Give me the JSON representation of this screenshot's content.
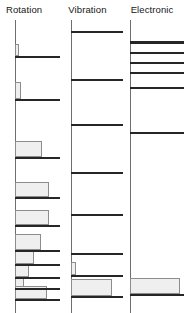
{
  "figure": {
    "width": 187,
    "height": 313,
    "background": "#ffffff",
    "bar_color": "#262626",
    "box_fill": "#efefef",
    "box_stroke": "#8c8c8c",
    "axis_color": "#6e6e6e"
  },
  "chart_data": {
    "type": "bar",
    "title": "",
    "subtitle": "",
    "xlabel": "",
    "ylabel": "",
    "grid": false,
    "legend": "none",
    "orientation": "horizontal",
    "panels": [
      {
        "label": "Rotation",
        "axis_x_pct": 24,
        "bars": [
          {
            "y_pct": 12.4,
            "start_pct": 24,
            "width_pct": 72,
            "thickness_px": 2
          },
          {
            "y_pct": 26.8,
            "start_pct": 24,
            "width_pct": 72,
            "thickness_px": 2
          },
          {
            "y_pct": 46.6,
            "start_pct": 24,
            "width_pct": 72,
            "thickness_px": 2
          },
          {
            "y_pct": 60.5,
            "start_pct": 24,
            "width_pct": 72,
            "thickness_px": 2
          },
          {
            "y_pct": 70.0,
            "start_pct": 24,
            "width_pct": 72,
            "thickness_px": 2
          },
          {
            "y_pct": 78.5,
            "start_pct": 24,
            "width_pct": 72,
            "thickness_px": 2
          },
          {
            "y_pct": 83.4,
            "start_pct": 24,
            "width_pct": 72,
            "thickness_px": 2
          },
          {
            "y_pct": 87.6,
            "start_pct": 24,
            "width_pct": 72,
            "thickness_px": 2
          },
          {
            "y_pct": 91.4,
            "start_pct": 24,
            "width_pct": 72,
            "thickness_px": 2
          },
          {
            "y_pct": 95.2,
            "start_pct": 24,
            "width_pct": 72,
            "thickness_px": 2
          }
        ],
        "boxes": [
          {
            "y_pct": 8.2,
            "height_pct": 4.2,
            "start_pct": 24,
            "width_pct": 7
          },
          {
            "y_pct": 21.2,
            "height_pct": 5.6,
            "start_pct": 24,
            "width_pct": 10
          },
          {
            "y_pct": 41.4,
            "height_pct": 5.2,
            "start_pct": 24,
            "width_pct": 44
          },
          {
            "y_pct": 55.2,
            "height_pct": 5.3,
            "start_pct": 24,
            "width_pct": 55
          },
          {
            "y_pct": 64.8,
            "height_pct": 5.2,
            "start_pct": 24,
            "width_pct": 55
          },
          {
            "y_pct": 73.2,
            "height_pct": 5.3,
            "start_pct": 24,
            "width_pct": 41
          },
          {
            "y_pct": 78.2,
            "height_pct": 5.2,
            "start_pct": 24,
            "width_pct": 30
          },
          {
            "y_pct": 83.1,
            "height_pct": 4.5,
            "start_pct": 24,
            "width_pct": 22
          },
          {
            "y_pct": 87.3,
            "height_pct": 4.1,
            "start_pct": 24,
            "width_pct": 14
          },
          {
            "y_pct": 90.8,
            "height_pct": 4.4,
            "start_pct": 24,
            "width_pct": 51
          }
        ]
      },
      {
        "label": "Vibration",
        "axis_x_pct": 14,
        "bars": [
          {
            "y_pct": 3.8,
            "start_pct": 14,
            "width_pct": 84,
            "thickness_px": 2
          },
          {
            "y_pct": 20.1,
            "start_pct": 14,
            "width_pct": 84,
            "thickness_px": 2
          },
          {
            "y_pct": 35.4,
            "start_pct": 14,
            "width_pct": 84,
            "thickness_px": 2
          },
          {
            "y_pct": 51.9,
            "start_pct": 14,
            "width_pct": 84,
            "thickness_px": 2
          },
          {
            "y_pct": 66.3,
            "start_pct": 14,
            "width_pct": 84,
            "thickness_px": 2
          },
          {
            "y_pct": 79.5,
            "start_pct": 14,
            "width_pct": 84,
            "thickness_px": 2
          },
          {
            "y_pct": 87.1,
            "start_pct": 14,
            "width_pct": 84,
            "thickness_px": 2
          },
          {
            "y_pct": 94.1,
            "start_pct": 14,
            "width_pct": 84,
            "thickness_px": 2
          }
        ],
        "boxes": [
          {
            "y_pct": 82.6,
            "height_pct": 4.5,
            "start_pct": 14,
            "width_pct": 8
          },
          {
            "y_pct": 88.4,
            "height_pct": 5.7,
            "start_pct": 14,
            "width_pct": 66
          }
        ]
      },
      {
        "label": "Electronic",
        "axis_x_pct": 9,
        "bars": [
          {
            "y_pct": 7.2,
            "start_pct": 9,
            "width_pct": 86,
            "thickness_px": 3
          },
          {
            "y_pct": 10.9,
            "start_pct": 9,
            "width_pct": 86,
            "thickness_px": 2
          },
          {
            "y_pct": 14.3,
            "start_pct": 9,
            "width_pct": 86,
            "thickness_px": 2
          },
          {
            "y_pct": 17.8,
            "start_pct": 9,
            "width_pct": 86,
            "thickness_px": 2
          },
          {
            "y_pct": 22.9,
            "start_pct": 9,
            "width_pct": 86,
            "thickness_px": 2
          },
          {
            "y_pct": 38.3,
            "start_pct": 9,
            "width_pct": 86,
            "thickness_px": 2
          },
          {
            "y_pct": 93.6,
            "start_pct": 9,
            "width_pct": 86,
            "thickness_px": 2
          }
        ],
        "boxes": [
          {
            "y_pct": 87.9,
            "height_pct": 5.7,
            "start_pct": 9,
            "width_pct": 80
          }
        ]
      }
    ]
  }
}
